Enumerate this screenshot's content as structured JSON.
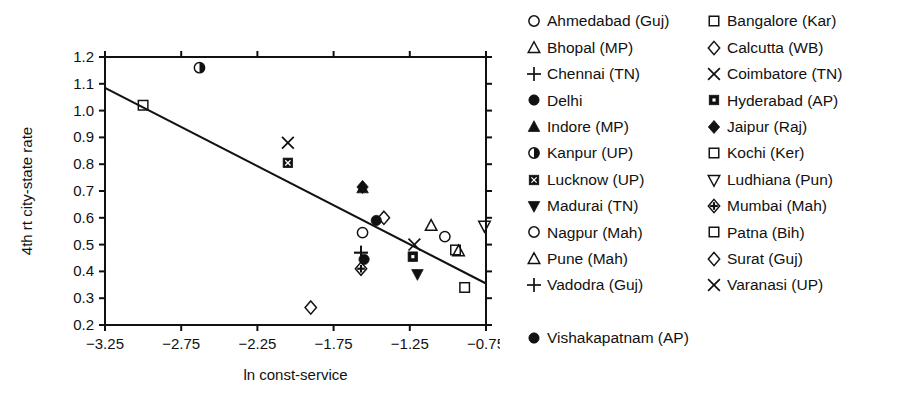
{
  "chart_data": {
    "type": "scatter",
    "title": "",
    "xlabel": "ln const-service",
    "ylabel": "4th rt city-state rate",
    "xlim": [
      -3.25,
      -0.75
    ],
    "ylim": [
      0.2,
      1.2
    ],
    "xticks": [
      "-3.25",
      "-2.75",
      "-2.25",
      "-1.75",
      "-1.25",
      "-0.75"
    ],
    "xtick_values": [
      -3.25,
      -2.75,
      -2.25,
      -1.75,
      -1.25,
      -0.75
    ],
    "yticks": [
      "0.2",
      "0.3",
      "0.4",
      "0.5",
      "0.6",
      "0.7",
      "0.8",
      "0.9",
      "1.0",
      "1.1",
      "1.2"
    ],
    "ytick_values": [
      0.2,
      0.3,
      0.4,
      0.5,
      0.6,
      0.7,
      0.8,
      0.9,
      1.0,
      1.1,
      1.2
    ],
    "grid": false,
    "legend_position": "right",
    "fit_line": {
      "x": [
        -3.25,
        -0.75
      ],
      "y": [
        1.085,
        0.355
      ]
    },
    "points": [
      {
        "label": "Ahmedabad (Guj)",
        "marker": "circle-open",
        "x": -1.02,
        "y": 0.53
      },
      {
        "label": "Bhopal (MP)",
        "marker": "triangle-up-open",
        "x": -1.11,
        "y": 0.57
      },
      {
        "label": "Chennai (TN)",
        "marker": "plus",
        "x": -1.57,
        "y": 0.47
      },
      {
        "label": "Delhi",
        "marker": "circle-filled",
        "x": -1.47,
        "y": 0.59
      },
      {
        "label": "Indore (MP)",
        "marker": "triangle-up-filled",
        "x": -1.56,
        "y": 0.71
      },
      {
        "label": "Kanpur (UP)",
        "marker": "circle-half",
        "x": -2.63,
        "y": 1.16
      },
      {
        "label": "Lucknow (UP)",
        "marker": "square-x-filled",
        "x": -2.05,
        "y": 0.805
      },
      {
        "label": "Madurai (TN)",
        "marker": "triangle-down-filled",
        "x": -1.2,
        "y": 0.39
      },
      {
        "label": "Nagpur (Mah)",
        "marker": "circle-open",
        "x": -1.56,
        "y": 0.545
      },
      {
        "label": "Pune (Mah)",
        "marker": "triangle-up-open",
        "x": -0.93,
        "y": 0.475
      },
      {
        "label": "Vadodra (Guj)",
        "marker": "plus",
        "x": -1.57,
        "y": 0.47
      },
      {
        "label": "Vishakapatnam (AP)",
        "marker": "circle-filled",
        "x": -1.55,
        "y": 0.445
      },
      {
        "label": "Bangalore (Kar)",
        "marker": "square-open",
        "x": -0.95,
        "y": 0.48
      },
      {
        "label": "Calcutta (WB)",
        "marker": "diamond-open",
        "x": -1.9,
        "y": 0.265
      },
      {
        "label": "Coimbatore (TN)",
        "marker": "x-mark",
        "x": -2.05,
        "y": 0.88
      },
      {
        "label": "Hyderabad (AP)",
        "marker": "square-dot-filled",
        "x": -1.23,
        "y": 0.455
      },
      {
        "label": "Jaipur (Raj)",
        "marker": "diamond-filled",
        "x": -1.56,
        "y": 0.715
      },
      {
        "label": "Kochi (Ker)",
        "marker": "square-open",
        "x": -3.0,
        "y": 1.02
      },
      {
        "label": "Ludhiana (Pun)",
        "marker": "triangle-down-open",
        "x": -0.76,
        "y": 0.57
      },
      {
        "label": "Mumbai (Mah)",
        "marker": "diamond-cross",
        "x": -1.57,
        "y": 0.41
      },
      {
        "label": "Patna (Bih)",
        "marker": "square-open",
        "x": -0.89,
        "y": 0.34
      },
      {
        "label": "Surat (Guj)",
        "marker": "diamond-open",
        "x": -1.42,
        "y": 0.6
      },
      {
        "label": "Varanasi (UP)",
        "marker": "x-mark",
        "x": -1.22,
        "y": 0.5
      }
    ]
  },
  "legend": {
    "left_column": [
      {
        "label": "Ahmedabad (Guj)",
        "marker": "circle-open"
      },
      {
        "label": "Bhopal (MP)",
        "marker": "triangle-up-open"
      },
      {
        "label": "Chennai (TN)",
        "marker": "plus"
      },
      {
        "label": "Delhi",
        "marker": "circle-filled"
      },
      {
        "label": "Indore (MP)",
        "marker": "triangle-up-filled"
      },
      {
        "label": "Kanpur (UP)",
        "marker": "circle-half"
      },
      {
        "label": "Lucknow (UP)",
        "marker": "square-x-filled"
      },
      {
        "label": "Madurai (TN)",
        "marker": "triangle-down-filled"
      },
      {
        "label": "Nagpur (Mah)",
        "marker": "circle-open"
      },
      {
        "label": "Pune (Mah)",
        "marker": "triangle-up-open"
      },
      {
        "label": "Vadodra (Guj)",
        "marker": "plus"
      }
    ],
    "right_column": [
      {
        "label": "Bangalore (Kar)",
        "marker": "square-open"
      },
      {
        "label": "Calcutta (WB)",
        "marker": "diamond-open"
      },
      {
        "label": "Coimbatore (TN)",
        "marker": "x-mark"
      },
      {
        "label": "Hyderabad (AP)",
        "marker": "square-dot-filled"
      },
      {
        "label": "Jaipur (Raj)",
        "marker": "diamond-filled"
      },
      {
        "label": "Kochi (Ker)",
        "marker": "square-open"
      },
      {
        "label": "Ludhiana (Pun)",
        "marker": "triangle-down-open"
      },
      {
        "label": "Mumbai (Mah)",
        "marker": "diamond-cross"
      },
      {
        "label": "Patna (Bih)",
        "marker": "square-open"
      },
      {
        "label": "Surat (Guj)",
        "marker": "diamond-open"
      },
      {
        "label": "Varanasi (UP)",
        "marker": "x-mark"
      }
    ],
    "last_row": {
      "label": "Vishakapatnam (AP)",
      "marker": "circle-filled"
    }
  },
  "colors": {
    "ink": "#111111",
    "background": "#ffffff"
  }
}
